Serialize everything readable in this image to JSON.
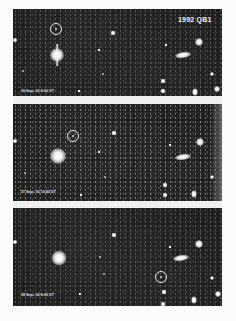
{
  "figure": {
    "object_label": "1992 QB1",
    "panels": [
      {
        "position": "top",
        "caption": "30 Sept. 92 9:00 UT",
        "top": 9,
        "height": 87
      },
      {
        "position": "middle",
        "caption": "27 Sept. 92 10:40 UT",
        "top": 104,
        "height": 97
      },
      {
        "position": "bottom",
        "caption": "28 Sept. 92 8:00 UT",
        "top": 208,
        "height": 98
      }
    ]
  },
  "colors": {
    "sky_background": "#1c1c1c",
    "page_background": "#fbfbfb",
    "marker": "#e6e6e6"
  }
}
